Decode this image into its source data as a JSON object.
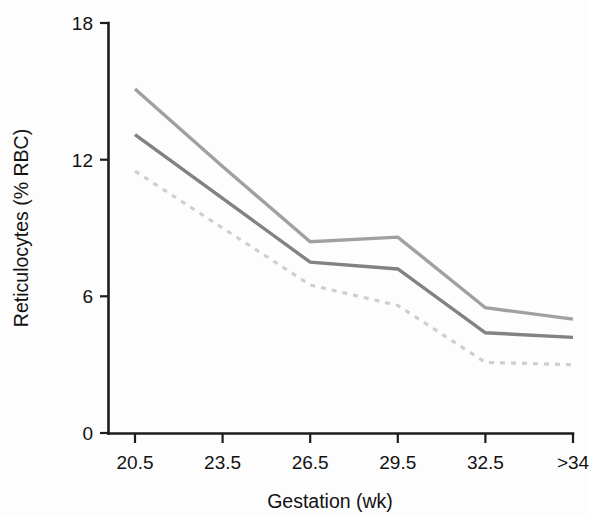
{
  "figure": {
    "background_color": "#fdfdfd",
    "axis_color": "#1c1c1c",
    "text_color": "#121212"
  },
  "chart_data": {
    "type": "line",
    "title": "",
    "xlabel": "Gestation (wk)",
    "ylabel": "Reticulocytes (% RBC)",
    "categories": [
      "20.5",
      "23.5",
      "26.5",
      "29.5",
      "32.5",
      ">34"
    ],
    "xtick_labels": [
      "20.5",
      "23.5",
      "26.5",
      "29.5",
      "32.5",
      ">34"
    ],
    "ytick_labels": [
      "0",
      "6",
      "12",
      "18"
    ],
    "yticks": [
      0,
      6,
      12,
      18
    ],
    "ylim": [
      0,
      18
    ],
    "grid": false,
    "legend": "none",
    "series": [
      {
        "name": "upper-curve",
        "style": "solid",
        "color": "#a0a0a0",
        "stroke_width": 3.4,
        "x": [
          "20.5",
          "23.5",
          "26.5",
          "29.5",
          "32.5",
          ">34"
        ],
        "values": [
          15.1,
          11.7,
          8.4,
          8.6,
          5.5,
          5.0
        ]
      },
      {
        "name": "middle-curve",
        "style": "solid",
        "color": "#828282",
        "stroke_width": 3.4,
        "x": [
          "20.5",
          "23.5",
          "26.5",
          "29.5",
          "32.5",
          ">34"
        ],
        "values": [
          13.1,
          10.3,
          7.5,
          7.2,
          4.4,
          4.2
        ]
      },
      {
        "name": "lower-curve",
        "style": "dashed",
        "color": "#cfcfcf",
        "stroke_width": 3.2,
        "dash_pattern": "5 6",
        "x": [
          "20.5",
          "23.5",
          "26.5",
          "29.5",
          "32.5",
          ">34"
        ],
        "values": [
          11.5,
          9.0,
          6.5,
          5.6,
          3.1,
          3.0
        ]
      }
    ]
  }
}
